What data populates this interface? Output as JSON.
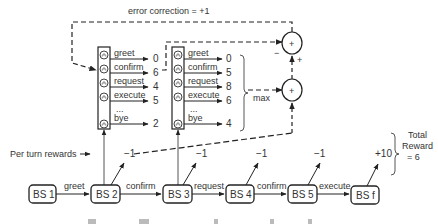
{
  "error_correction": {
    "label": "error correction = +1"
  },
  "q_table_1": {
    "actions": [
      {
        "label": "greet",
        "value": "0"
      },
      {
        "label": "confirm",
        "value": "6"
      },
      {
        "label": "request",
        "value": "4"
      },
      {
        "label": "execute",
        "value": "5"
      },
      {
        "label": "...",
        "value": ""
      },
      {
        "label": "bye",
        "value": "2"
      }
    ]
  },
  "q_table_2": {
    "actions": [
      {
        "label": "greet",
        "value": "0"
      },
      {
        "label": "confirm",
        "value": "5"
      },
      {
        "label": "request",
        "value": "8"
      },
      {
        "label": "execute",
        "value": "6"
      },
      {
        "label": "...",
        "value": ""
      },
      {
        "label": "bye",
        "value": "4"
      }
    ]
  },
  "max_label": "max",
  "adders": {
    "symbol": "+",
    "minus_sign": "−",
    "plus_sign": "+"
  },
  "per_turn_rewards_label": "Per turn rewards",
  "belief_states": [
    "BS 1",
    "BS 2",
    "BS 3",
    "BS 4",
    "BS 5",
    "BS f"
  ],
  "transitions": [
    "greet",
    "confirm",
    "request",
    "confirm",
    "execute"
  ],
  "rewards": [
    "−1",
    "−1",
    "−1",
    "−1",
    "+10"
  ],
  "total_reward": {
    "line1": "Total",
    "line2": "Reward",
    "line3": "= 6"
  },
  "caption_fragments": [
    "Fi",
    "T",
    "l",
    "f",
    "d"
  ]
}
